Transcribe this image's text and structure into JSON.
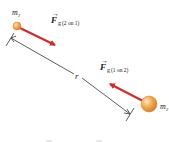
{
  "diagram": {
    "mass1": {
      "label": "m",
      "subscript": "1"
    },
    "mass2": {
      "label": "m",
      "subscript": "2"
    },
    "force_on_1": {
      "symbol": "F",
      "subscript": "g",
      "qualifier": "(2 on 1)"
    },
    "force_on_2": {
      "symbol": "F",
      "subscript": "g",
      "qualifier": "(1 on 2)"
    },
    "distance_label": "r",
    "colors": {
      "force_arrow": "#d42a2a",
      "mass_fill": "#f0a040",
      "mass_highlight": "#fde0b0",
      "dimension_line": "#333333"
    }
  }
}
